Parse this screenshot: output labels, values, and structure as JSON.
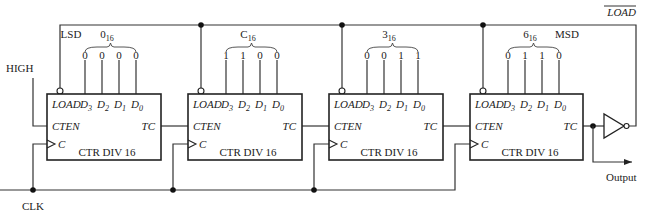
{
  "signals": {
    "high": "HIGH",
    "clk": "CLK",
    "load_bar": "LOAD",
    "output": "Output"
  },
  "labels": {
    "lsd": "LSD",
    "msd": "MSD"
  },
  "counters": [
    {
      "name": "CTR DIV 16",
      "digit": "0",
      "base": "16",
      "bits": [
        "0",
        "0",
        "0",
        "0"
      ],
      "role": "LSD"
    },
    {
      "name": "CTR DIV 16",
      "digit": "C",
      "base": "16",
      "bits": [
        "1",
        "1",
        "0",
        "0"
      ],
      "role": ""
    },
    {
      "name": "CTR DIV 16",
      "digit": "3",
      "base": "16",
      "bits": [
        "0",
        "0",
        "1",
        "1"
      ],
      "role": ""
    },
    {
      "name": "CTR DIV 16",
      "digit": "6",
      "base": "16",
      "bits": [
        "0",
        "1",
        "1",
        "0"
      ],
      "role": "MSD"
    }
  ],
  "pins": {
    "load": "LOAD",
    "d3": "D",
    "d3_sub": "3",
    "d2": "D",
    "d2_sub": "2",
    "d1": "D",
    "d1_sub": "1",
    "d0": "D",
    "d0_sub": "0",
    "cten": "CTEN",
    "tc": "TC",
    "c": "C"
  }
}
